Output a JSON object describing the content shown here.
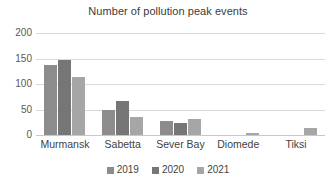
{
  "chart_data": {
    "type": "bar",
    "title": "Number of pollution peak events",
    "xlabel": "",
    "ylabel": "",
    "ylim": [
      0,
      200
    ],
    "yticks": [
      0,
      50,
      100,
      150,
      200
    ],
    "ytick_labels": [
      "0",
      "50",
      "100",
      "150",
      "200"
    ],
    "grid": true,
    "legend_position": "bottom",
    "categories": [
      "Murmansk",
      "Sabetta",
      "Sever Bay",
      "Diomede",
      "Tiksi"
    ],
    "series": [
      {
        "name": "2019",
        "color": "#8c8c8c",
        "values": [
          137,
          49,
          28,
          0,
          0
        ]
      },
      {
        "name": "2020",
        "color": "#767676",
        "values": [
          147,
          66,
          24,
          0,
          0
        ]
      },
      {
        "name": "2021",
        "color": "#a6a6a6",
        "values": [
          114,
          36,
          32,
          3,
          14
        ]
      }
    ]
  },
  "colors": {
    "background": "#ffffff",
    "gridline": "#d9d9d9",
    "axis": "#c8c8c8",
    "title_text": "#3b3b3b",
    "tick_text": "#595959",
    "category_text": "#3f3f3f"
  }
}
